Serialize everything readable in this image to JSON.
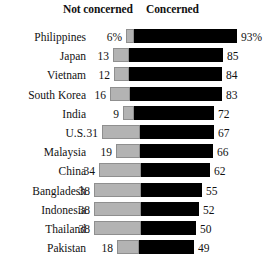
{
  "header": {
    "not_concerned_label": "Not concerned",
    "concerned_label": "Concerned"
  },
  "colors": {
    "not_concerned": "#b3b3b3",
    "concerned": "#000000",
    "background": "#ffffff",
    "text": "#111111"
  },
  "chart_data": {
    "type": "bar",
    "orientation": "horizontal",
    "stacked": true,
    "title": "",
    "subtitle": "",
    "xlabel": "",
    "ylabel": "",
    "grid": false,
    "legend_position": "top",
    "xlim": [
      0,
      100
    ],
    "categories": [
      "Philippines",
      "Japan",
      "Vietnam",
      "South Korea",
      "India",
      "U.S.",
      "Malaysia",
      "China",
      "Bangladesh",
      "Indonesia",
      "Thailand",
      "Pakistan"
    ],
    "series": [
      {
        "name": "Not concerned",
        "values": [
          6,
          13,
          12,
          16,
          9,
          31,
          19,
          34,
          38,
          38,
          38,
          18
        ],
        "labels": [
          "6%",
          "13",
          "12",
          "16",
          "9",
          "31",
          "19",
          "34",
          "38",
          "38",
          "38",
          "18"
        ]
      },
      {
        "name": "Concerned",
        "values": [
          93,
          85,
          84,
          83,
          72,
          67,
          66,
          62,
          55,
          52,
          50,
          49
        ],
        "labels": [
          "93%",
          "85",
          "84",
          "83",
          "72",
          "67",
          "66",
          "62",
          "55",
          "52",
          "50",
          "49"
        ]
      }
    ]
  },
  "rows": [
    {
      "country": "Philippines",
      "not_label": "6%",
      "not_value": 6,
      "con_label": "93%",
      "con_value": 93,
      "gray_left": 126,
      "gray_w": 8,
      "black_w": 103
    },
    {
      "country": "Japan",
      "not_label": "13",
      "not_value": 13,
      "con_label": "85",
      "con_value": 85,
      "gray_left": 113,
      "gray_w": 16,
      "black_w": 94
    },
    {
      "country": "Vietnam",
      "not_label": "12",
      "not_value": 12,
      "con_label": "84",
      "con_value": 84,
      "gray_left": 114,
      "gray_w": 15,
      "black_w": 93
    },
    {
      "country": "South Korea",
      "not_label": "16",
      "not_value": 16,
      "con_label": "83",
      "con_value": 83,
      "gray_left": 110,
      "gray_w": 20,
      "black_w": 92
    },
    {
      "country": "India",
      "not_label": "9",
      "not_value": 9,
      "con_label": "72",
      "con_value": 72,
      "gray_left": 123,
      "gray_w": 11,
      "black_w": 80
    },
    {
      "country": "U.S.",
      "not_label": "31",
      "not_value": 31,
      "con_label": "67",
      "con_value": 67,
      "gray_left": 102,
      "gray_w": 38,
      "black_w": 74
    },
    {
      "country": "Malaysia",
      "not_label": "19",
      "not_value": 19,
      "con_label": "66",
      "con_value": 66,
      "gray_left": 116,
      "gray_w": 24,
      "black_w": 73
    },
    {
      "country": "China",
      "not_label": "34",
      "not_value": 34,
      "con_label": "62",
      "con_value": 62,
      "gray_left": 99,
      "gray_w": 42,
      "black_w": 69
    },
    {
      "country": "Bangladesh",
      "not_label": "38",
      "not_value": 38,
      "con_label": "55",
      "con_value": 55,
      "gray_left": 94,
      "gray_w": 47,
      "black_w": 61
    },
    {
      "country": "Indonesia",
      "not_label": "38",
      "not_value": 38,
      "con_label": "52",
      "con_value": 52,
      "gray_left": 94,
      "gray_w": 47,
      "black_w": 58
    },
    {
      "country": "Thailand",
      "not_label": "38",
      "not_value": 38,
      "con_label": "50",
      "con_value": 50,
      "gray_left": 94,
      "gray_w": 47,
      "black_w": 55
    },
    {
      "country": "Pakistan",
      "not_label": "18",
      "not_value": 18,
      "con_label": "49",
      "con_value": 49,
      "gray_left": 117,
      "gray_w": 22,
      "black_w": 55
    }
  ],
  "layout": {
    "row_top_start": 29,
    "row_pitch": 19.2
  }
}
